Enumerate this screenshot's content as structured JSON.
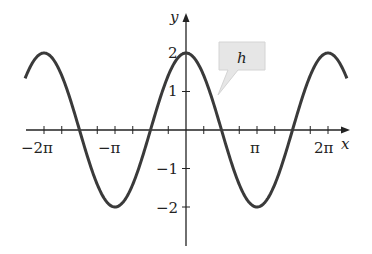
{
  "chart_data": {
    "type": "line",
    "title": "",
    "function": "h(x) = 2cos(x)",
    "series": [
      {
        "name": "h",
        "amplitude": 2,
        "period": "2π",
        "x_range": [
          -7.12,
          7.12
        ]
      }
    ],
    "x": [
      -6.2832,
      -4.7124,
      -3.1416,
      -1.5708,
      0,
      1.5708,
      3.1416,
      4.7124,
      6.2832
    ],
    "values": [
      2,
      0,
      -2,
      0,
      2,
      0,
      -2,
      0,
      2
    ],
    "xlabel": "x",
    "ylabel": "y",
    "xlim": [
      -7.4,
      7.4
    ],
    "ylim": [
      -3,
      3
    ],
    "x_ticks": [
      "−2π",
      "−π",
      "π",
      "2π"
    ],
    "y_ticks": [
      "2",
      "1",
      "−1",
      "−2"
    ],
    "x_minor_tick_step": "π/4",
    "annotations": [
      {
        "text": "h",
        "type": "callout",
        "points_to": "curve"
      }
    ],
    "grid": false,
    "legend": "none"
  },
  "axis": {
    "x_label": "x",
    "y_label": "y"
  },
  "ticks": {
    "x": [
      {
        "label": "−2π",
        "px": 44
      },
      {
        "label": "−π",
        "px": 115
      },
      {
        "label": "π",
        "px": 257
      },
      {
        "label": "2π",
        "px": 328
      }
    ],
    "y": [
      {
        "label": "2",
        "py": 53
      },
      {
        "label": "1",
        "py": 91
      },
      {
        "label": "−1",
        "py": 169
      },
      {
        "label": "−2",
        "py": 208
      }
    ]
  },
  "callout": {
    "label": "h"
  },
  "colors": {
    "curve": "#3a3a3a",
    "axis": "#222222",
    "callout_fill": "#e6e6e6"
  }
}
